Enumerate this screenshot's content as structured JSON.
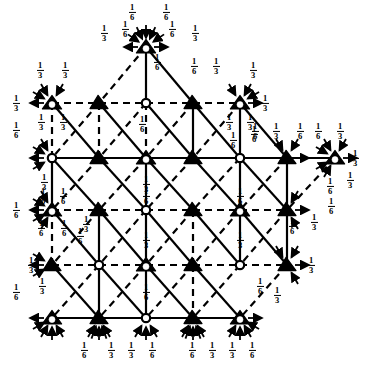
{
  "figure": {
    "type": "triangular-lattice-transition-diagram",
    "width": 372,
    "height": 373,
    "background": "#ffffff",
    "ink": "#000000"
  },
  "legend": {
    "node_kinds": [
      {
        "key": "triangle-in-circle",
        "name": "triangle-in-circle-node"
      },
      {
        "key": "open-circle",
        "name": "open-circle-node"
      },
      {
        "key": "filled-triangle",
        "name": "filled-triangle-node"
      }
    ],
    "edge_kinds": [
      {
        "key": "solid",
        "name": "solid-edge"
      },
      {
        "key": "dashed",
        "name": "dashed-edge"
      }
    ]
  },
  "nodes": [
    {
      "id": "n0",
      "x": 146,
      "y": 47,
      "kind": "triangle-in-circle"
    },
    {
      "id": "n1",
      "x": 52,
      "y": 103,
      "kind": "triangle-in-circle"
    },
    {
      "id": "n2",
      "x": 99,
      "y": 103,
      "kind": "filled-triangle"
    },
    {
      "id": "n3",
      "x": 146,
      "y": 103,
      "kind": "open-circle"
    },
    {
      "id": "n4",
      "x": 193,
      "y": 103,
      "kind": "filled-triangle"
    },
    {
      "id": "n5",
      "x": 240,
      "y": 103,
      "kind": "triangle-in-circle"
    },
    {
      "id": "n6",
      "x": 52,
      "y": 158,
      "kind": "open-circle"
    },
    {
      "id": "n7",
      "x": 99,
      "y": 158,
      "kind": "filled-triangle"
    },
    {
      "id": "n8",
      "x": 146,
      "y": 158,
      "kind": "triangle-in-circle"
    },
    {
      "id": "n9",
      "x": 193,
      "y": 158,
      "kind": "filled-triangle"
    },
    {
      "id": "n10",
      "x": 240,
      "y": 158,
      "kind": "open-circle"
    },
    {
      "id": "n11",
      "x": 287,
      "y": 158,
      "kind": "filled-triangle"
    },
    {
      "id": "n12",
      "x": 335,
      "y": 158,
      "kind": "triangle-in-circle"
    },
    {
      "id": "n13",
      "x": 52,
      "y": 210,
      "kind": "triangle-in-circle"
    },
    {
      "id": "n14",
      "x": 99,
      "y": 210,
      "kind": "filled-triangle"
    },
    {
      "id": "n15",
      "x": 146,
      "y": 210,
      "kind": "open-circle"
    },
    {
      "id": "n16",
      "x": 193,
      "y": 210,
      "kind": "filled-triangle"
    },
    {
      "id": "n17",
      "x": 240,
      "y": 210,
      "kind": "triangle-in-circle"
    },
    {
      "id": "n18",
      "x": 287,
      "y": 210,
      "kind": "filled-triangle"
    },
    {
      "id": "n19",
      "x": 52,
      "y": 265,
      "kind": "filled-triangle"
    },
    {
      "id": "n20",
      "x": 99,
      "y": 265,
      "kind": "open-circle"
    },
    {
      "id": "n21",
      "x": 146,
      "y": 265,
      "kind": "triangle-in-circle"
    },
    {
      "id": "n22",
      "x": 193,
      "y": 265,
      "kind": "filled-triangle"
    },
    {
      "id": "n23",
      "x": 240,
      "y": 265,
      "kind": "open-circle"
    },
    {
      "id": "n24",
      "x": 287,
      "y": 265,
      "kind": "filled-triangle"
    },
    {
      "id": "n25",
      "x": 52,
      "y": 318,
      "kind": "triangle-in-circle"
    },
    {
      "id": "n26",
      "x": 99,
      "y": 318,
      "kind": "filled-triangle"
    },
    {
      "id": "n27",
      "x": 146,
      "y": 318,
      "kind": "open-circle"
    },
    {
      "id": "n28",
      "x": 193,
      "y": 318,
      "kind": "filled-triangle"
    },
    {
      "id": "n29",
      "x": 240,
      "y": 318,
      "kind": "triangle-in-circle"
    }
  ],
  "labels": [
    {
      "text": "1/6",
      "x": 132,
      "y": 12
    },
    {
      "text": "1/6",
      "x": 166,
      "y": 12
    },
    {
      "text": "1/3",
      "x": 104,
      "y": 33
    },
    {
      "text": "1/6",
      "x": 125,
      "y": 29
    },
    {
      "text": "1/6",
      "x": 172,
      "y": 29
    },
    {
      "text": "1/3",
      "x": 195,
      "y": 33
    },
    {
      "text": "1/6",
      "x": 157,
      "y": 62
    },
    {
      "text": "1/3",
      "x": 40,
      "y": 70
    },
    {
      "text": "1/3",
      "x": 65,
      "y": 70
    },
    {
      "text": "1/6",
      "x": 194,
      "y": 66
    },
    {
      "text": "1/3",
      "x": 216,
      "y": 66
    },
    {
      "text": "1/3",
      "x": 253,
      "y": 70
    },
    {
      "text": "1/3",
      "x": 16,
      "y": 103
    },
    {
      "text": "1/3",
      "x": 265,
      "y": 103
    },
    {
      "text": "1/3",
      "x": 41,
      "y": 122
    },
    {
      "text": "1/3",
      "x": 63,
      "y": 122
    },
    {
      "text": "1/3",
      "x": 229,
      "y": 122
    },
    {
      "text": "1/3",
      "x": 250,
      "y": 122
    },
    {
      "text": "1/6",
      "x": 16,
      "y": 130
    },
    {
      "text": "1/6",
      "x": 142,
      "y": 124
    },
    {
      "text": "1/6",
      "x": 233,
      "y": 140
    },
    {
      "text": "1/6",
      "x": 255,
      "y": 131
    },
    {
      "text": "1/6",
      "x": 254,
      "y": 134
    },
    {
      "text": "1/3",
      "x": 276,
      "y": 131
    },
    {
      "text": "1/6",
      "x": 300,
      "y": 131
    },
    {
      "text": "1/6",
      "x": 318,
      "y": 131
    },
    {
      "text": "1/3",
      "x": 340,
      "y": 131
    },
    {
      "text": "1/3",
      "x": 355,
      "y": 158
    },
    {
      "text": "1/3",
      "x": 44,
      "y": 182
    },
    {
      "text": "1/3",
      "x": 146,
      "y": 184
    },
    {
      "text": "1/3",
      "x": 350,
      "y": 180
    },
    {
      "text": "1/6",
      "x": 330,
      "y": 186
    },
    {
      "text": "1/6",
      "x": 43,
      "y": 196
    },
    {
      "text": "1/6",
      "x": 63,
      "y": 196
    },
    {
      "text": "1/6",
      "x": 16,
      "y": 210
    },
    {
      "text": "1/6",
      "x": 146,
      "y": 196
    },
    {
      "text": "1/6",
      "x": 240,
      "y": 196
    },
    {
      "text": "1/6",
      "x": 331,
      "y": 206
    },
    {
      "text": "1/6",
      "x": 41,
      "y": 228
    },
    {
      "text": "1/6",
      "x": 64,
      "y": 228
    },
    {
      "text": "1/3",
      "x": 86,
      "y": 224
    },
    {
      "text": "1/6",
      "x": 292,
      "y": 226
    },
    {
      "text": "1/3",
      "x": 314,
      "y": 222
    },
    {
      "text": "1/6",
      "x": 80,
      "y": 236
    },
    {
      "text": "1/3",
      "x": 146,
      "y": 240
    },
    {
      "text": "1/3",
      "x": 240,
      "y": 240
    },
    {
      "text": "1/3",
      "x": 31,
      "y": 265
    },
    {
      "text": "1/3",
      "x": 311,
      "y": 265
    },
    {
      "text": "1/3",
      "x": 42,
      "y": 286
    },
    {
      "text": "1/6",
      "x": 16,
      "y": 292
    },
    {
      "text": "1/6",
      "x": 146,
      "y": 292
    },
    {
      "text": "1/6",
      "x": 260,
      "y": 286
    },
    {
      "text": "1/3",
      "x": 277,
      "y": 295
    },
    {
      "text": "1/6",
      "x": 84,
      "y": 350
    },
    {
      "text": "1/3",
      "x": 111,
      "y": 350
    },
    {
      "text": "1/3",
      "x": 131,
      "y": 350
    },
    {
      "text": "1/6",
      "x": 152,
      "y": 350
    },
    {
      "text": "1/6",
      "x": 192,
      "y": 350
    },
    {
      "text": "1/3",
      "x": 212,
      "y": 350
    },
    {
      "text": "1/3",
      "x": 232,
      "y": 350
    },
    {
      "text": "1/6",
      "x": 252,
      "y": 350
    }
  ],
  "chart_data": {
    "type": "diagram",
    "title": "",
    "fraction_values": [
      "1/6",
      "1/3"
    ],
    "node_count": 30,
    "row_y": [
      47,
      103,
      158,
      210,
      265,
      318
    ],
    "col_x": [
      52,
      99,
      146,
      193,
      240,
      287,
      335
    ]
  }
}
